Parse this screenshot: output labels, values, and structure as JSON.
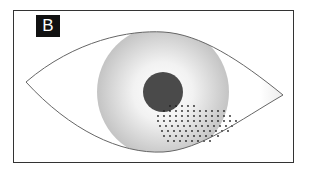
{
  "figure": {
    "panel_label": "B",
    "colors": {
      "frame": "#333333",
      "label_bg": "#111111",
      "label_text": "#ffffff",
      "eye_outline": "#666666",
      "iris_light": "#f4f4f4",
      "iris_dark": "#c8c8c8",
      "pupil": "#4a4a4a",
      "dots": "#222222"
    }
  }
}
